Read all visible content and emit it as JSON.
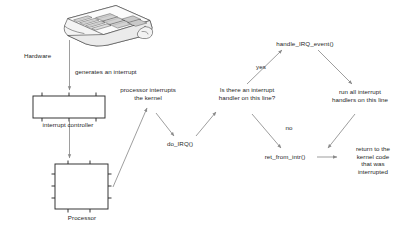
{
  "diagram": {
    "type": "flowchart",
    "background_color": "#ffffff",
    "line_color": "#7a7a7a",
    "box_stroke_color": "#2b2b2b",
    "text_color": "#262626"
  },
  "nodes": {
    "hardware_label": "Hardware",
    "interrupt_controller_label": "interrupt controller",
    "processor_label": "Processor",
    "decision": "Is there an interrupt\nhandler on this line?",
    "handle_irq_event": "handle_IRQ_event()",
    "run_all_handlers": "run all interrupt\nhandlers on this line",
    "do_irq": "do_IRQ()",
    "ret_from_intr": "ret_from_intr()",
    "return_to_kernel": "return to  the\nkernel code\nthat was\ninterrupted"
  },
  "edges": {
    "generates_an_interrupt": "generates an interrupt",
    "processor_interrupts_the_kernel": "processor interrupts\nthe kernel",
    "yes": "yes",
    "no": "no"
  },
  "icons": {
    "keyboard": "keyboard-icon",
    "interrupt_controller_chip": "chip-icon",
    "processor_chip": "chip-icon"
  }
}
